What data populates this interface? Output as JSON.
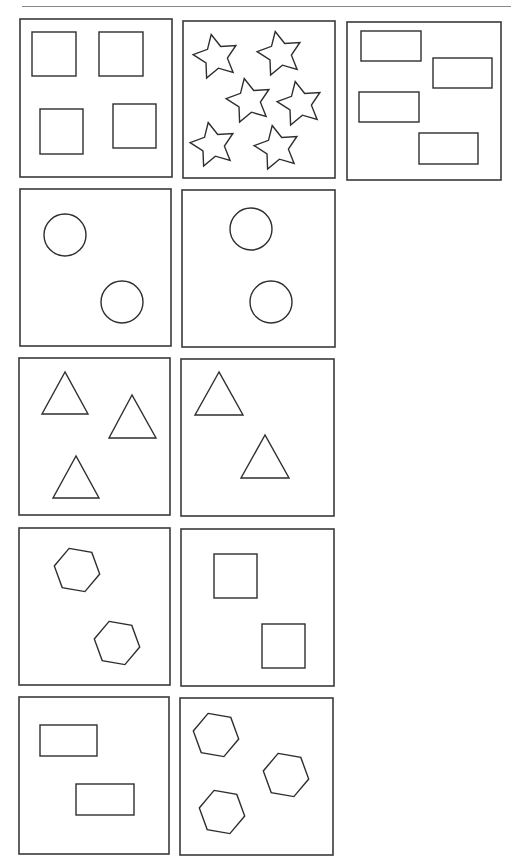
{
  "worksheet": {
    "title": "",
    "colors": {
      "line": "#2e2e2e",
      "box": "#3a3a3a",
      "rule_top": "#8a8a8a",
      "rule_bottom": "#9a9a9a",
      "background": "#ffffff"
    },
    "rules": {
      "top": {
        "x1": 22,
        "y1": 6.5,
        "x2": 511,
        "y2": 6.5
      },
      "bottom": {
        "x1": 0,
        "y1": 866,
        "x2": 517,
        "y2": 866
      }
    },
    "panels": [
      {
        "id": "squares-4",
        "label": "4 squares",
        "box": {
          "x": 20,
          "y": 19,
          "w": 152,
          "h": 158
        },
        "shapes": [
          {
            "type": "rect",
            "x": 32,
            "y": 32,
            "w": 44,
            "h": 44
          },
          {
            "type": "rect",
            "x": 99,
            "y": 32,
            "w": 44,
            "h": 44
          },
          {
            "type": "rect",
            "x": 40,
            "y": 109,
            "w": 43,
            "h": 45
          },
          {
            "type": "rect",
            "x": 113,
            "y": 104,
            "w": 43,
            "h": 44
          }
        ]
      },
      {
        "id": "stars-6",
        "label": "6 stars",
        "box": {
          "x": 183,
          "y": 21,
          "w": 152,
          "h": 157
        },
        "shapes": [
          {
            "type": "star",
            "cx": 216,
            "cy": 57,
            "r": 23,
            "rot": -12
          },
          {
            "type": "star",
            "cx": 280,
            "cy": 54,
            "r": 23,
            "rot": -12
          },
          {
            "type": "star",
            "cx": 249,
            "cy": 101,
            "r": 23,
            "rot": -12
          },
          {
            "type": "star",
            "cx": 300,
            "cy": 104,
            "r": 23,
            "rot": -12
          },
          {
            "type": "star",
            "cx": 213,
            "cy": 145,
            "r": 23,
            "rot": -12
          },
          {
            "type": "star",
            "cx": 277,
            "cy": 148,
            "r": 23,
            "rot": -12
          }
        ]
      },
      {
        "id": "rectangles-4",
        "label": "4 rectangles",
        "box": {
          "x": 347,
          "y": 22,
          "w": 154,
          "h": 158
        },
        "shapes": [
          {
            "type": "rect",
            "x": 361,
            "y": 31,
            "w": 60,
            "h": 30
          },
          {
            "type": "rect",
            "x": 433,
            "y": 58,
            "w": 59,
            "h": 30
          },
          {
            "type": "rect",
            "x": 359,
            "y": 92,
            "w": 60,
            "h": 30
          },
          {
            "type": "rect",
            "x": 419,
            "y": 133,
            "w": 59,
            "h": 31
          }
        ]
      },
      {
        "id": "circles-2a",
        "label": "2 circles",
        "box": {
          "x": 20,
          "y": 189,
          "w": 151,
          "h": 157
        },
        "shapes": [
          {
            "type": "circle",
            "cx": 65,
            "cy": 235,
            "r": 21
          },
          {
            "type": "circle",
            "cx": 122,
            "cy": 302,
            "r": 21
          }
        ]
      },
      {
        "id": "circles-2b",
        "label": "2 circles",
        "box": {
          "x": 182,
          "y": 190,
          "w": 153,
          "h": 157
        },
        "shapes": [
          {
            "type": "circle",
            "cx": 251,
            "cy": 229,
            "r": 21
          },
          {
            "type": "circle",
            "cx": 271,
            "cy": 302,
            "r": 21
          }
        ]
      },
      {
        "id": "triangles-3",
        "label": "3 triangles",
        "box": {
          "x": 19,
          "y": 358,
          "w": 151,
          "h": 157
        },
        "shapes": [
          {
            "type": "triangle",
            "points": [
              [
                65,
                372
              ],
              [
                42,
                414
              ],
              [
                88,
                414
              ]
            ]
          },
          {
            "type": "triangle",
            "points": [
              [
                132,
                395
              ],
              [
                109,
                438
              ],
              [
                156,
                438
              ]
            ]
          },
          {
            "type": "triangle",
            "points": [
              [
                76,
                456
              ],
              [
                53,
                498
              ],
              [
                99,
                498
              ]
            ]
          }
        ]
      },
      {
        "id": "triangles-2",
        "label": "2 triangles",
        "box": {
          "x": 181,
          "y": 359,
          "w": 153,
          "h": 157
        },
        "shapes": [
          {
            "type": "triangle",
            "points": [
              [
                219,
                372
              ],
              [
                195,
                415
              ],
              [
                243,
                415
              ]
            ]
          },
          {
            "type": "triangle",
            "points": [
              [
                265,
                435
              ],
              [
                241,
                478
              ],
              [
                289,
                478
              ]
            ]
          }
        ]
      },
      {
        "id": "hexagons-2",
        "label": "2 hexagons",
        "box": {
          "x": 19,
          "y": 528,
          "w": 151,
          "h": 157
        },
        "shapes": [
          {
            "type": "hexagon",
            "cx": 77,
            "cy": 570,
            "r": 23,
            "rot": -20
          },
          {
            "type": "hexagon",
            "cx": 117,
            "cy": 643,
            "r": 23,
            "rot": -20
          }
        ]
      },
      {
        "id": "squares-2",
        "label": "2 squares",
        "box": {
          "x": 181,
          "y": 529,
          "w": 153,
          "h": 157
        },
        "shapes": [
          {
            "type": "rect",
            "x": 214,
            "y": 554,
            "w": 43,
            "h": 44
          },
          {
            "type": "rect",
            "x": 262,
            "y": 624,
            "w": 43,
            "h": 44
          }
        ]
      },
      {
        "id": "rectangles-2",
        "label": "2 rectangles",
        "box": {
          "x": 19,
          "y": 697,
          "w": 150,
          "h": 157
        },
        "shapes": [
          {
            "type": "rect",
            "x": 40,
            "y": 725,
            "w": 57,
            "h": 31
          },
          {
            "type": "rect",
            "x": 76,
            "y": 784,
            "w": 58,
            "h": 31
          }
        ]
      },
      {
        "id": "hexagons-3",
        "label": "3 hexagons",
        "box": {
          "x": 180,
          "y": 698,
          "w": 153,
          "h": 157
        },
        "shapes": [
          {
            "type": "hexagon",
            "cx": 216,
            "cy": 735,
            "r": 23,
            "rot": -20
          },
          {
            "type": "hexagon",
            "cx": 286,
            "cy": 775,
            "r": 23,
            "rot": -20
          },
          {
            "type": "hexagon",
            "cx": 222,
            "cy": 812,
            "r": 23,
            "rot": -20
          }
        ]
      }
    ]
  }
}
